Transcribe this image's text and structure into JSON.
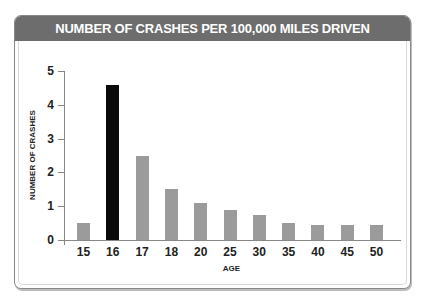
{
  "chart_data": {
    "type": "bar",
    "title": "NUMBER OF CRASHES PER 100,000 MILES DRIVEN",
    "xlabel": "AGE",
    "ylabel": "NUMBER OF CRASHES",
    "categories": [
      "15",
      "16",
      "17",
      "18",
      "20",
      "25",
      "30",
      "35",
      "40",
      "45",
      "50"
    ],
    "values": [
      0.5,
      4.6,
      2.5,
      1.5,
      1.1,
      0.9,
      0.75,
      0.5,
      0.45,
      0.45,
      0.45
    ],
    "highlight_category": "16",
    "ylim": [
      0,
      5
    ],
    "yticks": [
      "0",
      "1",
      "2",
      "3",
      "4",
      "5"
    ],
    "grid": false,
    "legend": null,
    "colors": {
      "bar": "#9b9b9b",
      "highlight_bar": "#0a0a0a",
      "header_bg": "#6d6d6d",
      "header_text": "#ffffff"
    }
  }
}
